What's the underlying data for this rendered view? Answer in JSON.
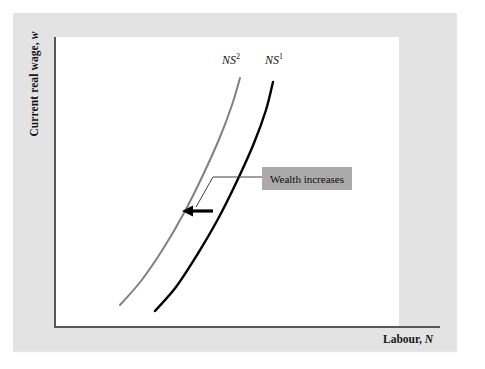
{
  "figure": {
    "background_color": "#ffffff",
    "panel_color": "#e3e3e3",
    "plot_area_color": "#ffffff"
  },
  "axes": {
    "y_title_text": "Current real wage, ",
    "y_title_variable": "w",
    "x_title_text": "Labour, ",
    "x_title_variable": "N",
    "axis_color": "#55595c"
  },
  "annotation": {
    "label": "Wealth increases",
    "box_color": "#aaaaaa",
    "leader_color": "#3f3f3f",
    "arrow_color": "#000000",
    "arrow_direction": "left"
  },
  "chart_data": {
    "type": "line",
    "title": "",
    "xlabel": "Labour, N",
    "ylabel": "Current real wage, w",
    "grid": false,
    "legend": "inline-curve-labels",
    "axis_ticks": [],
    "note": "Upward-sloping convex labour supply curves; an increase in wealth shifts labour supply leftward from NS1 to NS2.",
    "series": [
      {
        "name": "NS2",
        "label": "NS",
        "superscript": "2",
        "color": "#808080",
        "stroke_width": 2,
        "label_position": {
          "x": 222,
          "y": 52
        },
        "points": [
          {
            "x": 120,
            "y": 305
          },
          {
            "x": 141,
            "y": 281
          },
          {
            "x": 163,
            "y": 249
          },
          {
            "x": 184,
            "y": 213
          },
          {
            "x": 203,
            "y": 175
          },
          {
            "x": 220,
            "y": 137
          },
          {
            "x": 232,
            "y": 105
          },
          {
            "x": 240,
            "y": 78
          }
        ]
      },
      {
        "name": "NS1",
        "label": "NS",
        "superscript": "1",
        "color": "#000000",
        "stroke_width": 2.4,
        "label_position": {
          "x": 265,
          "y": 52
        },
        "points": [
          {
            "x": 155,
            "y": 311
          },
          {
            "x": 176,
            "y": 287
          },
          {
            "x": 197,
            "y": 255
          },
          {
            "x": 218,
            "y": 219
          },
          {
            "x": 237,
            "y": 181
          },
          {
            "x": 254,
            "y": 143
          },
          {
            "x": 266,
            "y": 110
          },
          {
            "x": 273,
            "y": 82
          }
        ]
      }
    ],
    "annotations": [
      {
        "type": "arrow",
        "text": "Wealth increases",
        "tail": {
          "x": 213,
          "y": 211
        },
        "head": {
          "x": 182,
          "y": 211
        },
        "leader_path": "M 262 177 L 213 177 L 196 207"
      }
    ]
  }
}
